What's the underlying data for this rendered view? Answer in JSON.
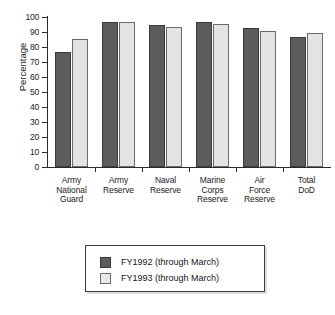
{
  "chart_data": {
    "type": "bar",
    "title": "",
    "xlabel": "",
    "ylabel": "Percentage",
    "ylim": [
      0,
      100
    ],
    "ytick_step": 10,
    "yticks": [
      0,
      10,
      20,
      30,
      40,
      50,
      60,
      70,
      80,
      90,
      100
    ],
    "ytick_labels": [
      "0",
      "10",
      "20",
      "30",
      "40",
      "50",
      "60",
      "70",
      "80",
      "90",
      "100"
    ],
    "grid": false,
    "legend_position": "below-plot-center",
    "categories": [
      "Army National Guard",
      "Army Reserve",
      "Naval Reserve",
      "Marine Corps Reserve",
      "Air Force Reserve",
      "Total DoD"
    ],
    "category_label_lines": [
      [
        "Army",
        "National",
        "Guard"
      ],
      [
        "Army",
        "Reserve"
      ],
      [
        "Naval",
        "Reserve"
      ],
      [
        "Marine",
        "Corps",
        "Reserve"
      ],
      [
        "Air",
        "Force",
        "Reserve"
      ],
      [
        "Total",
        "DoD"
      ]
    ],
    "series": [
      {
        "name": "FY1992 (through March)",
        "color": "#5c5c5c",
        "values": [
          77,
          97,
          94.5,
          97,
          93,
          86.5
        ]
      },
      {
        "name": "FY1993 (through March)",
        "color": "#e3e3e1",
        "values": [
          85.5,
          97,
          93.5,
          95.5,
          91,
          89.5
        ]
      }
    ]
  },
  "legend": {
    "items": [
      {
        "label": "FY1992 (through March)"
      },
      {
        "label": "FY1993 (through March)"
      }
    ]
  }
}
